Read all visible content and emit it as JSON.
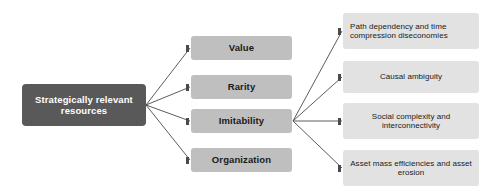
{
  "diagram": {
    "colors": {
      "root_fill": "#595959",
      "root_text": "#ffffff",
      "mid_fill": "#bfbfbf",
      "leaf_fill": "#e2e2e2",
      "node_text": "#1a1a1a",
      "connector": "#4a4a4a",
      "background": "#ffffff"
    },
    "root": {
      "label": "Strategically relevant resources",
      "x": 22,
      "y": 84,
      "w": 124,
      "h": 42
    },
    "criteria": [
      {
        "label": "Value",
        "x": 191,
        "y": 36,
        "w": 101,
        "h": 24
      },
      {
        "label": "Rarity",
        "x": 191,
        "y": 75,
        "w": 101,
        "h": 24
      },
      {
        "label": "Imitability",
        "x": 191,
        "y": 109,
        "w": 101,
        "h": 24
      },
      {
        "label": "Organization",
        "x": 191,
        "y": 148,
        "w": 101,
        "h": 24
      }
    ],
    "imitability_drivers": [
      {
        "label": "Path dependency and time compression diseconomies",
        "align": "left",
        "x": 343,
        "y": 13,
        "w": 136,
        "h": 36
      },
      {
        "label": "Causal ambiguity",
        "align": "center",
        "x": 343,
        "y": 61,
        "w": 136,
        "h": 32
      },
      {
        "label": "Social complexity and interconnectivity",
        "align": "center",
        "x": 343,
        "y": 103,
        "w": 136,
        "h": 36
      },
      {
        "label": "Asset mass efficiencies and asset erosion",
        "align": "center",
        "x": 343,
        "y": 150,
        "w": 136,
        "h": 36
      }
    ],
    "edges": {
      "root_hub": {
        "x": 146,
        "y": 105
      },
      "imitability_hub": {
        "x": 293,
        "y": 121
      },
      "root_targets_y": [
        48,
        87,
        121,
        160
      ],
      "driver_targets_y": [
        31,
        77,
        121,
        168
      ]
    }
  }
}
